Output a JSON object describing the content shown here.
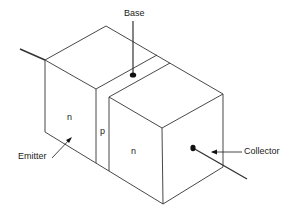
{
  "diagram": {
    "type": "npn-transistor-block",
    "labels": {
      "base": "Base",
      "emitter": "Emitter",
      "collector": "Collector",
      "emitter_region": "n",
      "base_region": "p",
      "collector_region": "n"
    },
    "colors": {
      "line": "#333333",
      "background": "#ffffff"
    }
  }
}
